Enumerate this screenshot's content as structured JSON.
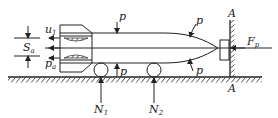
{
  "diagram": {
    "labels": {
      "u1": {
        "main": "u",
        "sub": "1"
      },
      "Sa": {
        "main": "S",
        "sub": "a"
      },
      "pa": {
        "main": "p",
        "sub": "a"
      },
      "p_top_mid": "p",
      "p_top_nose": "p",
      "p_bottom_mid": "p",
      "p_bottom_nose": "p",
      "N1": {
        "main": "N",
        "sub": "1"
      },
      "N2": {
        "main": "N",
        "sub": "2"
      },
      "Fp": {
        "main": "F",
        "sub": "p"
      },
      "A_top": "A",
      "A_bottom": "A"
    },
    "colors": {
      "ink": "#222222",
      "background": "#ffffff"
    }
  }
}
